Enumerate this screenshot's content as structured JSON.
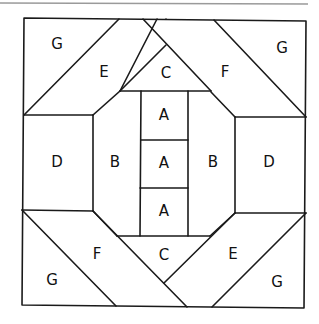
{
  "diagram": {
    "type": "quilt-block-pattern",
    "labels": [
      {
        "id": "g-top-left",
        "text": "G",
        "x": 57,
        "y": 44
      },
      {
        "id": "e-top-left",
        "text": "E",
        "x": 104,
        "y": 72
      },
      {
        "id": "c-top",
        "text": "C",
        "x": 166,
        "y": 73
      },
      {
        "id": "f-top-right",
        "text": "F",
        "x": 225,
        "y": 72
      },
      {
        "id": "g-top-right",
        "text": "G",
        "x": 282,
        "y": 48
      },
      {
        "id": "d-left",
        "text": "D",
        "x": 57,
        "y": 162
      },
      {
        "id": "b-left",
        "text": "B",
        "x": 115,
        "y": 162
      },
      {
        "id": "a-top",
        "text": "A",
        "x": 164,
        "y": 115
      },
      {
        "id": "a-middle",
        "text": "A",
        "x": 164,
        "y": 163
      },
      {
        "id": "a-bottom",
        "text": "A",
        "x": 164,
        "y": 211
      },
      {
        "id": "b-right",
        "text": "B",
        "x": 213,
        "y": 162
      },
      {
        "id": "d-right",
        "text": "D",
        "x": 269,
        "y": 162
      },
      {
        "id": "f-bottom-left",
        "text": "F",
        "x": 97,
        "y": 254
      },
      {
        "id": "c-bottom",
        "text": "C",
        "x": 164,
        "y": 255
      },
      {
        "id": "e-bottom-right",
        "text": "E",
        "x": 233,
        "y": 254
      },
      {
        "id": "g-bottom-left",
        "text": "G",
        "x": 52,
        "y": 280
      },
      {
        "id": "g-bottom-right",
        "text": "G",
        "x": 277,
        "y": 282
      }
    ]
  }
}
